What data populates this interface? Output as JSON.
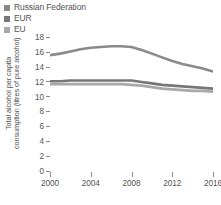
{
  "legend": {
    "position": "top-left",
    "items": [
      {
        "label": "Russian Federation",
        "color": "#8a8a8a",
        "marker": "square-marker"
      },
      {
        "label": "EUR",
        "color": "#777777",
        "marker": "square-marker"
      },
      {
        "label": "EU",
        "color": "#a8a8a8",
        "marker": "square-marker"
      }
    ]
  },
  "axes": {
    "y_title_line1": "Total alcohol per capita",
    "y_title_line2": "consumption (litres of pure alcohol)",
    "y_title": "Total alcohol per capita consumption (litres of pure alcohol)",
    "y_ticks": [
      "18",
      "16",
      "14",
      "12",
      "10",
      "8",
      "6",
      "4",
      "2",
      "0"
    ],
    "x_ticks": [
      "2000",
      "2004",
      "2008",
      "2012",
      "2016"
    ]
  },
  "chart_data": {
    "type": "line",
    "title": "",
    "subtitle": "",
    "xlabel": "",
    "ylabel": "Total alcohol per capita consumption (litres of pure alcohol)",
    "xlim": [
      2000,
      2016
    ],
    "ylim": [
      0,
      18
    ],
    "ytick_step": 2,
    "grid": false,
    "legend_position": "top-left",
    "x": [
      2000,
      2001,
      2002,
      2003,
      2004,
      2005,
      2006,
      2007,
      2008,
      2009,
      2010,
      2011,
      2012,
      2013,
      2014,
      2015,
      2016
    ],
    "series": [
      {
        "name": "Russian Federation",
        "color": "#8a8a8a",
        "values": [
          15.7,
          15.9,
          16.2,
          16.5,
          16.7,
          16.8,
          16.9,
          16.9,
          16.8,
          16.4,
          15.9,
          15.4,
          14.9,
          14.5,
          14.2,
          13.9,
          13.5
        ]
      },
      {
        "name": "EUR",
        "color": "#777777",
        "values": [
          12.2,
          12.2,
          12.3,
          12.3,
          12.3,
          12.3,
          12.3,
          12.3,
          12.3,
          12.1,
          11.9,
          11.7,
          11.6,
          11.5,
          11.4,
          11.3,
          11.2
        ]
      },
      {
        "name": "EU",
        "color": "#a8a8a8",
        "values": [
          11.8,
          11.8,
          11.8,
          11.8,
          11.8,
          11.8,
          11.8,
          11.8,
          11.7,
          11.6,
          11.4,
          11.2,
          11.1,
          11.0,
          10.9,
          10.9,
          10.8
        ]
      }
    ]
  }
}
